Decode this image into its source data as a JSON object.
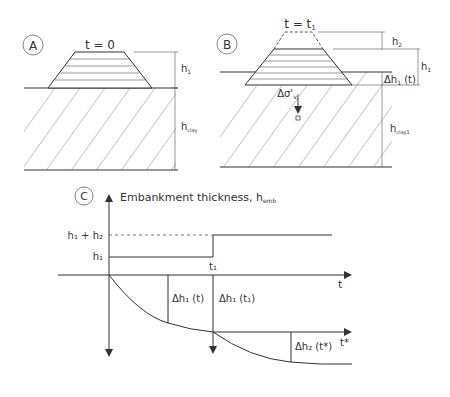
{
  "panel_a": {
    "label": "A",
    "time_label": "t = 0",
    "height_label": "h",
    "height_sub": "1",
    "clay_label": "h",
    "clay_sub": "clay"
  },
  "panel_b": {
    "label": "B",
    "time_label": "t = t",
    "time_sub": "1",
    "h2_label": "h",
    "h2_sub": "2",
    "h1_label": "h",
    "h1_sub": "1",
    "settlement_label": "Δh",
    "settlement_sub": "1",
    "settlement_arg": " (t)",
    "stress_label": "Δσ'",
    "stress_sub": "vf",
    "clay_label": "h",
    "clay_sub": "clay1"
  },
  "panel_c": {
    "label": "C",
    "y_axis_title": "Embankment thickness, h",
    "y_axis_sub": "emb",
    "tick_h1h2": "h₁ + h₂",
    "tick_h1": "h₁",
    "t1_label": "t₁",
    "t_axis": "t",
    "tstar_axis": "t*",
    "dh1_t": "Δh₁ (t)",
    "dh1_t1": "Δh₁ (t₁)",
    "dh2_tstar": "Δh₂ (t*)"
  }
}
